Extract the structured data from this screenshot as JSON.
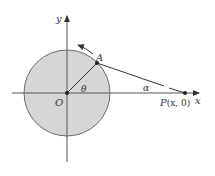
{
  "diagram": {
    "type": "geometry",
    "colors": {
      "circle_fill": "#d6d6d6",
      "circle_stroke": "#6b6b6b",
      "axis": "#555555",
      "line": "#333333"
    },
    "labels": {
      "y_axis": "y",
      "x_axis": "x",
      "origin": "O",
      "point_a": "A",
      "theta": "θ",
      "alpha": "α",
      "point_p": "P",
      "point_p_coords": "(x, 0)"
    },
    "elements": {
      "circle": {
        "cx": 67,
        "cy": 93,
        "r": 43
      },
      "origin": {
        "x": 67,
        "y": 93
      },
      "point_a": {
        "x": 97,
        "y": 63
      },
      "point_p": {
        "x": 185,
        "y": 93
      },
      "rotation_arrow": "counterclockwise"
    }
  }
}
